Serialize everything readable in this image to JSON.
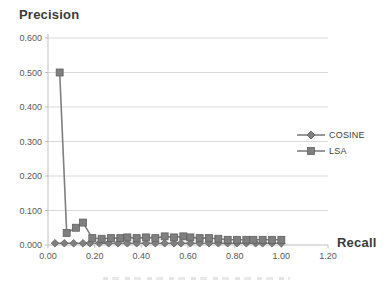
{
  "figure": {
    "y_axis_title": "Precision",
    "x_axis_title": "Recall"
  },
  "colors": {
    "series_fill": "#7f7f7f",
    "series_stroke": "#616161",
    "gridline": "#d9d9d9",
    "axis_line": "#bfbfbf",
    "tick_text": "#595959",
    "title_text": "#3a3a3a"
  },
  "chart_data": {
    "type": "line",
    "title": "",
    "xlabel": "Recall",
    "ylabel": "Precision",
    "xlim": [
      0,
      1.2
    ],
    "ylim": [
      0,
      0.6
    ],
    "grid": true,
    "legend_position": "right",
    "x_tick_values": [
      0.0,
      0.2,
      0.4,
      0.6,
      0.8,
      1.0,
      1.2
    ],
    "x_tick_labels": [
      "0.00",
      "0.20",
      "0.40",
      "0.60",
      "0.80",
      "1.00",
      "1.20"
    ],
    "y_tick_values": [
      0.0,
      0.1,
      0.2,
      0.3,
      0.4,
      0.5,
      0.6
    ],
    "y_tick_labels": [
      "0.000",
      "0.100",
      "0.200",
      "0.300",
      "0.400",
      "0.500",
      "0.600"
    ],
    "series": [
      {
        "name": "COSINE",
        "marker": "diamond",
        "color": "#7f7f7f",
        "x": [
          0.03,
          0.07,
          0.11,
          0.15,
          0.18,
          0.22,
          0.26,
          0.3,
          0.34,
          0.38,
          0.42,
          0.46,
          0.5,
          0.54,
          0.57,
          0.61,
          0.65,
          0.69,
          0.73,
          0.77,
          0.81,
          0.85,
          0.89,
          0.92,
          0.96,
          1.0
        ],
        "y": [
          0.005,
          0.005,
          0.005,
          0.005,
          0.005,
          0.005,
          0.005,
          0.005,
          0.005,
          0.005,
          0.005,
          0.005,
          0.005,
          0.005,
          0.005,
          0.005,
          0.005,
          0.005,
          0.005,
          0.005,
          0.005,
          0.005,
          0.005,
          0.005,
          0.005,
          0.005
        ]
      },
      {
        "name": "LSA",
        "marker": "square",
        "color": "#7f7f7f",
        "x": [
          0.05,
          0.08,
          0.12,
          0.15,
          0.19,
          0.23,
          0.27,
          0.31,
          0.34,
          0.38,
          0.42,
          0.46,
          0.5,
          0.54,
          0.58,
          0.61,
          0.65,
          0.69,
          0.73,
          0.77,
          0.81,
          0.85,
          0.88,
          0.92,
          0.96,
          1.0
        ],
        "y": [
          0.5,
          0.035,
          0.05,
          0.065,
          0.02,
          0.018,
          0.02,
          0.02,
          0.022,
          0.02,
          0.022,
          0.02,
          0.025,
          0.022,
          0.025,
          0.022,
          0.02,
          0.02,
          0.018,
          0.015,
          0.015,
          0.015,
          0.015,
          0.015,
          0.015,
          0.015
        ]
      }
    ]
  }
}
